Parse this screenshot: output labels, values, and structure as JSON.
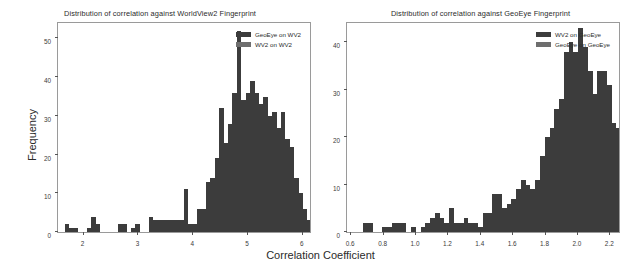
{
  "figure": {
    "shared_xlabel": "Correlation Coefficient",
    "colors": {
      "series1": "#3c3c3c",
      "series2": "#6e6e6e",
      "frame": "#9a9a9a",
      "background": "#ffffff",
      "text": "#2b2b2b"
    }
  },
  "chart_data": [
    {
      "type": "bar",
      "title": "Distribution of correlation against WorldView2 Fingerprint",
      "xlabel": "Correlation Coefficient",
      "ylabel": "Frequency",
      "xlim": [
        1.55,
        6.15
      ],
      "ylim": [
        0,
        54
      ],
      "xticks": [
        "2",
        "3",
        "4",
        "5",
        "6"
      ],
      "xtick_values": [
        2,
        3,
        4,
        5,
        6
      ],
      "yticks": [
        "0",
        "10",
        "20",
        "30",
        "40",
        "50"
      ],
      "ytick_values": [
        0,
        10,
        20,
        30,
        40,
        50
      ],
      "grid": false,
      "legend_position": "upper right",
      "bin_width": 0.0805,
      "bin_start": 1.595,
      "series": [
        {
          "name": "GeoEye on WV2",
          "color": "#3c3c3c",
          "values": [
            0,
            2,
            1,
            1,
            0,
            0,
            1,
            4,
            2,
            0,
            0,
            0,
            0,
            2,
            2,
            0,
            1,
            2,
            0,
            0,
            4,
            3,
            3,
            3,
            3,
            3,
            3,
            3,
            11,
            2,
            2,
            6,
            6,
            13,
            14,
            19,
            32,
            23,
            28,
            36,
            52,
            34,
            36,
            39,
            36,
            33,
            35,
            30,
            31,
            27,
            31,
            24,
            22,
            14,
            10,
            6,
            3,
            2,
            1,
            0,
            1,
            0,
            0,
            0,
            1
          ]
        },
        {
          "name": "WV2 on WV2",
          "color": "#6e6e6e",
          "values": [
            0,
            2,
            1,
            1,
            0,
            0,
            1,
            4,
            2,
            0,
            0,
            0,
            0,
            2,
            2,
            0,
            1,
            2,
            0,
            0,
            4,
            3,
            3,
            3,
            3,
            3,
            3,
            3,
            11,
            2,
            2,
            6,
            6,
            9,
            11,
            14,
            18,
            19,
            23,
            28,
            32,
            34,
            36,
            37,
            36,
            33,
            35,
            30,
            25,
            27,
            31,
            24,
            22,
            14,
            10,
            6,
            3,
            2,
            1,
            0,
            1,
            0,
            0,
            0,
            1
          ]
        }
      ],
      "legend": [
        "GeoEye on WV2",
        "WV2 on WV2"
      ]
    },
    {
      "type": "bar",
      "title": "Distribution of correlation against GeoEye Fingerprint",
      "xlabel": "Correlation Coefficient",
      "ylabel": "Frequency",
      "xlim": [
        0.58,
        2.26
      ],
      "ylim": [
        0,
        44
      ],
      "xticks": [
        "0.6",
        "0.8",
        "1.0",
        "1.2",
        "1.4",
        "1.6",
        "1.8",
        "2.0",
        "2.2"
      ],
      "xtick_values": [
        0.6,
        0.8,
        1.0,
        1.2,
        1.4,
        1.6,
        1.8,
        2.0,
        2.2
      ],
      "yticks": [
        "0",
        "10",
        "20",
        "30",
        "40"
      ],
      "ytick_values": [
        0,
        10,
        20,
        30,
        40
      ],
      "grid": false,
      "legend_position": "upper right",
      "bin_width": 0.0295,
      "bin_start": 0.592,
      "series": [
        {
          "name": "WV2 on GeoEye",
          "color": "#3c3c3c",
          "values": [
            0,
            0,
            0,
            2,
            2,
            0,
            0,
            1,
            1,
            2,
            2,
            2,
            0,
            1,
            0,
            1,
            2,
            3,
            4,
            3,
            2,
            5,
            2,
            2,
            3,
            2,
            2,
            1,
            4,
            4,
            8,
            8,
            5,
            6,
            7,
            9,
            11,
            10,
            9,
            11,
            16,
            20,
            22,
            26,
            28,
            38,
            40,
            38,
            43,
            39,
            34,
            29,
            34,
            34,
            31,
            23,
            22,
            24,
            16,
            11,
            9,
            5,
            3,
            2,
            2,
            1,
            0,
            1,
            0,
            0,
            1
          ]
        },
        {
          "name": "GeoEye on GeoEye",
          "color": "#6e6e6e",
          "values": [
            0,
            0,
            0,
            2,
            2,
            0,
            0,
            1,
            1,
            2,
            2,
            2,
            0,
            1,
            0,
            1,
            2,
            3,
            4,
            3,
            2,
            5,
            2,
            2,
            3,
            2,
            2,
            1,
            4,
            4,
            8,
            8,
            5,
            6,
            7,
            9,
            11,
            10,
            9,
            11,
            16,
            20,
            22,
            26,
            28,
            38,
            40,
            38,
            43,
            39,
            34,
            29,
            34,
            34,
            23,
            23,
            22,
            17,
            16,
            11,
            9,
            5,
            3,
            2,
            2,
            1,
            0,
            1,
            0,
            0,
            1
          ]
        }
      ],
      "legend": [
        "WV2 on GeoEye",
        "GeoEye on GeoEye"
      ]
    }
  ]
}
